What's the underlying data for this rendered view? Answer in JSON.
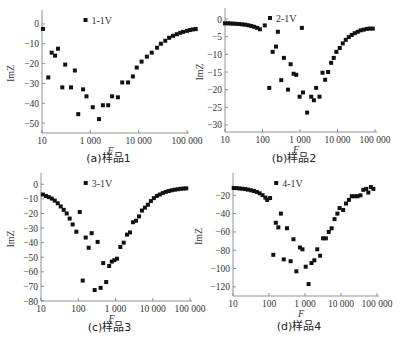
{
  "chart_data": [
    {
      "type": "scatter",
      "title": "",
      "caption": "(a)样品1",
      "xlabel": "F",
      "ylabel": "ImZ",
      "xscale": "log",
      "xlim_log10": [
        2,
        5
      ],
      "x_ticks": [
        {
          "log10": 2,
          "label": "10"
        },
        {
          "log10": 3,
          "label": "1 000"
        },
        {
          "log10": 4,
          "label": "10 000"
        },
        {
          "log10": 5,
          "label": "100 000"
        }
      ],
      "ylim": [
        -55,
        5
      ],
      "y_ticks": [
        0,
        -10,
        -20,
        -30,
        -40,
        -50
      ],
      "legend": "1-1V",
      "legend_position": "top-center",
      "series": [
        {
          "name": "1-1V",
          "points": [
            [
              2.02,
              -2.5
            ],
            [
              2.13,
              -27
            ],
            [
              2.2,
              -14.5
            ],
            [
              2.27,
              -16
            ],
            [
              2.33,
              -12.5
            ],
            [
              2.42,
              -32
            ],
            [
              2.48,
              -20.5
            ],
            [
              2.6,
              -32
            ],
            [
              2.68,
              -23.5
            ],
            [
              2.75,
              -45.5
            ],
            [
              2.85,
              -33
            ],
            [
              2.92,
              -36.5
            ],
            [
              3.05,
              -42
            ],
            [
              3.18,
              -48
            ],
            [
              3.26,
              -41
            ],
            [
              3.37,
              -41
            ],
            [
              3.45,
              -36.5
            ],
            [
              3.57,
              -37
            ],
            [
              3.66,
              -29.5
            ],
            [
              3.78,
              -29.5
            ],
            [
              3.88,
              -26.5
            ],
            [
              3.96,
              -22
            ],
            [
              4.06,
              -19
            ],
            [
              4.17,
              -16.5
            ],
            [
              4.27,
              -14.5
            ],
            [
              4.38,
              -12
            ],
            [
              4.46,
              -10
            ],
            [
              4.55,
              -8.5
            ],
            [
              4.63,
              -7
            ],
            [
              4.71,
              -6
            ],
            [
              4.79,
              -5.2
            ],
            [
              4.86,
              -4.5
            ],
            [
              4.92,
              -4
            ],
            [
              5.0,
              -3.5
            ],
            [
              5.06,
              -3.1
            ],
            [
              5.12,
              -2.8
            ],
            [
              5.18,
              -2.6
            ]
          ]
        }
      ]
    },
    {
      "type": "scatter",
      "title": "",
      "caption": "(b)样品2",
      "xlabel": "F",
      "ylabel": "ImZ",
      "xscale": "log",
      "xlim_log10": [
        1,
        5
      ],
      "x_ticks": [
        {
          "log10": 1,
          "label": "10"
        },
        {
          "log10": 2,
          "label": "100"
        },
        {
          "log10": 3,
          "label": "1 000"
        },
        {
          "log10": 4,
          "label": "10 000"
        },
        {
          "log10": 5,
          "label": "100 000"
        }
      ],
      "ylim": [
        -32,
        2
      ],
      "y_ticks": [
        0,
        -5,
        -10,
        -15,
        -20,
        -25,
        -30
      ],
      "legend": "2-1V",
      "legend_position": "top-center",
      "series": [
        {
          "name": "2-1V",
          "points": [
            [
              1.0,
              -1.2
            ],
            [
              1.08,
              -1.2
            ],
            [
              1.15,
              -1.25
            ],
            [
              1.22,
              -1.3
            ],
            [
              1.3,
              -1.35
            ],
            [
              1.38,
              -1.4
            ],
            [
              1.46,
              -1.5
            ],
            [
              1.54,
              -1.6
            ],
            [
              1.62,
              -1.75
            ],
            [
              1.7,
              -1.95
            ],
            [
              1.78,
              -2.2
            ],
            [
              1.86,
              -2.5
            ],
            [
              1.93,
              -2.9
            ],
            [
              2.06,
              -1.8
            ],
            [
              2.18,
              -19.5
            ],
            [
              2.27,
              -9.3
            ],
            [
              2.36,
              -7.8
            ],
            [
              2.41,
              -3.6
            ],
            [
              2.5,
              -17.3
            ],
            [
              2.57,
              -11
            ],
            [
              2.68,
              -20
            ],
            [
              2.75,
              -12.8
            ],
            [
              2.83,
              -15.5
            ],
            [
              2.9,
              -15.8
            ],
            [
              2.99,
              -22
            ],
            [
              3.05,
              -2.5
            ],
            [
              3.08,
              -20.8
            ],
            [
              3.19,
              -26.5
            ],
            [
              3.3,
              -22
            ],
            [
              3.37,
              -23
            ],
            [
              3.43,
              -19.5
            ],
            [
              3.52,
              -22
            ],
            [
              3.6,
              -15.2
            ],
            [
              3.67,
              -17.2
            ],
            [
              3.75,
              -15
            ],
            [
              3.83,
              -12.4
            ],
            [
              3.9,
              -11
            ],
            [
              3.97,
              -9.3
            ],
            [
              4.06,
              -8.2
            ],
            [
              4.14,
              -6.9
            ],
            [
              4.22,
              -5.9
            ],
            [
              4.3,
              -5.1
            ],
            [
              4.38,
              -4.5
            ],
            [
              4.46,
              -4
            ],
            [
              4.54,
              -3.6
            ],
            [
              4.62,
              -3.2
            ],
            [
              4.7,
              -3
            ],
            [
              4.78,
              -2.8
            ],
            [
              4.86,
              -2.7
            ],
            [
              4.94,
              -2.7
            ]
          ]
        }
      ]
    },
    {
      "type": "scatter",
      "title": "",
      "caption": "(c)样品3",
      "xlabel": "F",
      "ylabel": "ImZ",
      "xscale": "log",
      "xlim_log10": [
        1,
        5
      ],
      "x_ticks": [
        {
          "log10": 1,
          "label": "10"
        },
        {
          "log10": 2,
          "label": "100"
        },
        {
          "log10": 3,
          "label": "1 000"
        },
        {
          "log10": 4,
          "label": "10 000"
        },
        {
          "log10": 5,
          "label": "100 000"
        }
      ],
      "ylim": [
        -80,
        5
      ],
      "y_ticks": [
        0,
        -10,
        -20,
        -30,
        -40,
        -50,
        -60,
        -70,
        -80
      ],
      "legend": "3-1V",
      "legend_position": "top-center",
      "series": [
        {
          "name": "3-1V",
          "points": [
            [
              1.05,
              -7
            ],
            [
              1.13,
              -8
            ],
            [
              1.21,
              -8.8
            ],
            [
              1.29,
              -9.8
            ],
            [
              1.37,
              -11.2
            ],
            [
              1.45,
              -13
            ],
            [
              1.53,
              -15.2
            ],
            [
              1.61,
              -17.5
            ],
            [
              1.69,
              -20
            ],
            [
              1.77,
              -23.5
            ],
            [
              1.85,
              -27.5
            ],
            [
              1.95,
              -32.5
            ],
            [
              2.04,
              -19
            ],
            [
              2.12,
              -66
            ],
            [
              2.2,
              -36.5
            ],
            [
              2.28,
              -43.5
            ],
            [
              2.36,
              -33.5
            ],
            [
              2.44,
              -72.5
            ],
            [
              2.52,
              -39.5
            ],
            [
              2.6,
              -71
            ],
            [
              2.67,
              -54
            ],
            [
              2.75,
              -67
            ],
            [
              2.83,
              -56
            ],
            [
              2.9,
              -53
            ],
            [
              2.97,
              -52
            ],
            [
              3.04,
              -51
            ],
            [
              3.13,
              -43
            ],
            [
              3.22,
              -40
            ],
            [
              3.31,
              -34.5
            ],
            [
              3.39,
              -33
            ],
            [
              3.47,
              -26
            ],
            [
              3.55,
              -25
            ],
            [
              3.63,
              -22
            ],
            [
              3.71,
              -18
            ],
            [
              3.79,
              -16
            ],
            [
              3.87,
              -14
            ],
            [
              3.95,
              -11.5
            ],
            [
              4.03,
              -9.5
            ],
            [
              4.11,
              -8
            ],
            [
              4.19,
              -7
            ],
            [
              4.27,
              -6
            ],
            [
              4.35,
              -5.2
            ],
            [
              4.43,
              -4.6
            ],
            [
              4.51,
              -4.1
            ],
            [
              4.59,
              -3.7
            ],
            [
              4.67,
              -3.4
            ],
            [
              4.75,
              -3.1
            ],
            [
              4.83,
              -2.9
            ],
            [
              4.9,
              -2.8
            ]
          ]
        }
      ]
    },
    {
      "type": "scatter",
      "title": "",
      "caption": "(d)样品4",
      "xlabel": "F",
      "ylabel": "ImZ",
      "xscale": "log",
      "xlim_log10": [
        1,
        5
      ],
      "x_ticks": [
        {
          "log10": 1,
          "label": "10"
        },
        {
          "log10": 2,
          "label": "100"
        },
        {
          "log10": 3,
          "label": "1 000"
        },
        {
          "log10": 4,
          "label": "10 000"
        },
        {
          "log10": 5,
          "label": "100 000"
        }
      ],
      "ylim": [
        -130,
        0
      ],
      "y_ticks": [
        -20,
        -40,
        -60,
        -80,
        -100,
        -120
      ],
      "legend": "4-1V",
      "legend_position": "top-center",
      "series": [
        {
          "name": "4-1V",
          "points": [
            [
              1.02,
              -12
            ],
            [
              1.1,
              -12.2
            ],
            [
              1.18,
              -12.5
            ],
            [
              1.26,
              -12.8
            ],
            [
              1.34,
              -13.2
            ],
            [
              1.42,
              -13.8
            ],
            [
              1.5,
              -14.5
            ],
            [
              1.58,
              -15.3
            ],
            [
              1.66,
              -16.3
            ],
            [
              1.74,
              -17.8
            ],
            [
              1.82,
              -19.8
            ],
            [
              1.9,
              -22.5
            ],
            [
              1.95,
              -25
            ],
            [
              2.03,
              -23
            ],
            [
              2.12,
              -85
            ],
            [
              2.19,
              -50
            ],
            [
              2.26,
              -55
            ],
            [
              2.33,
              -40
            ],
            [
              2.41,
              -90
            ],
            [
              2.5,
              -56
            ],
            [
              2.6,
              -92
            ],
            [
              2.68,
              -68
            ],
            [
              2.76,
              -103
            ],
            [
              2.86,
              -77
            ],
            [
              2.93,
              -79
            ],
            [
              3.02,
              -98
            ],
            [
              3.1,
              -117
            ],
            [
              3.18,
              -94
            ],
            [
              3.26,
              -91
            ],
            [
              3.34,
              -79
            ],
            [
              3.42,
              -86
            ],
            [
              3.5,
              -67
            ],
            [
              3.58,
              -67
            ],
            [
              3.66,
              -60
            ],
            [
              3.74,
              -56
            ],
            [
              3.82,
              -46
            ],
            [
              3.9,
              -40
            ],
            [
              3.96,
              -34
            ],
            [
              4.06,
              -36
            ],
            [
              4.14,
              -29
            ],
            [
              4.22,
              -25
            ],
            [
              4.3,
              -21
            ],
            [
              4.38,
              -21
            ],
            [
              4.46,
              -21
            ],
            [
              4.54,
              -20
            ],
            [
              4.62,
              -14
            ],
            [
              4.7,
              -13
            ],
            [
              4.76,
              -17
            ],
            [
              4.83,
              -11
            ],
            [
              4.9,
              -13
            ]
          ]
        }
      ]
    }
  ]
}
